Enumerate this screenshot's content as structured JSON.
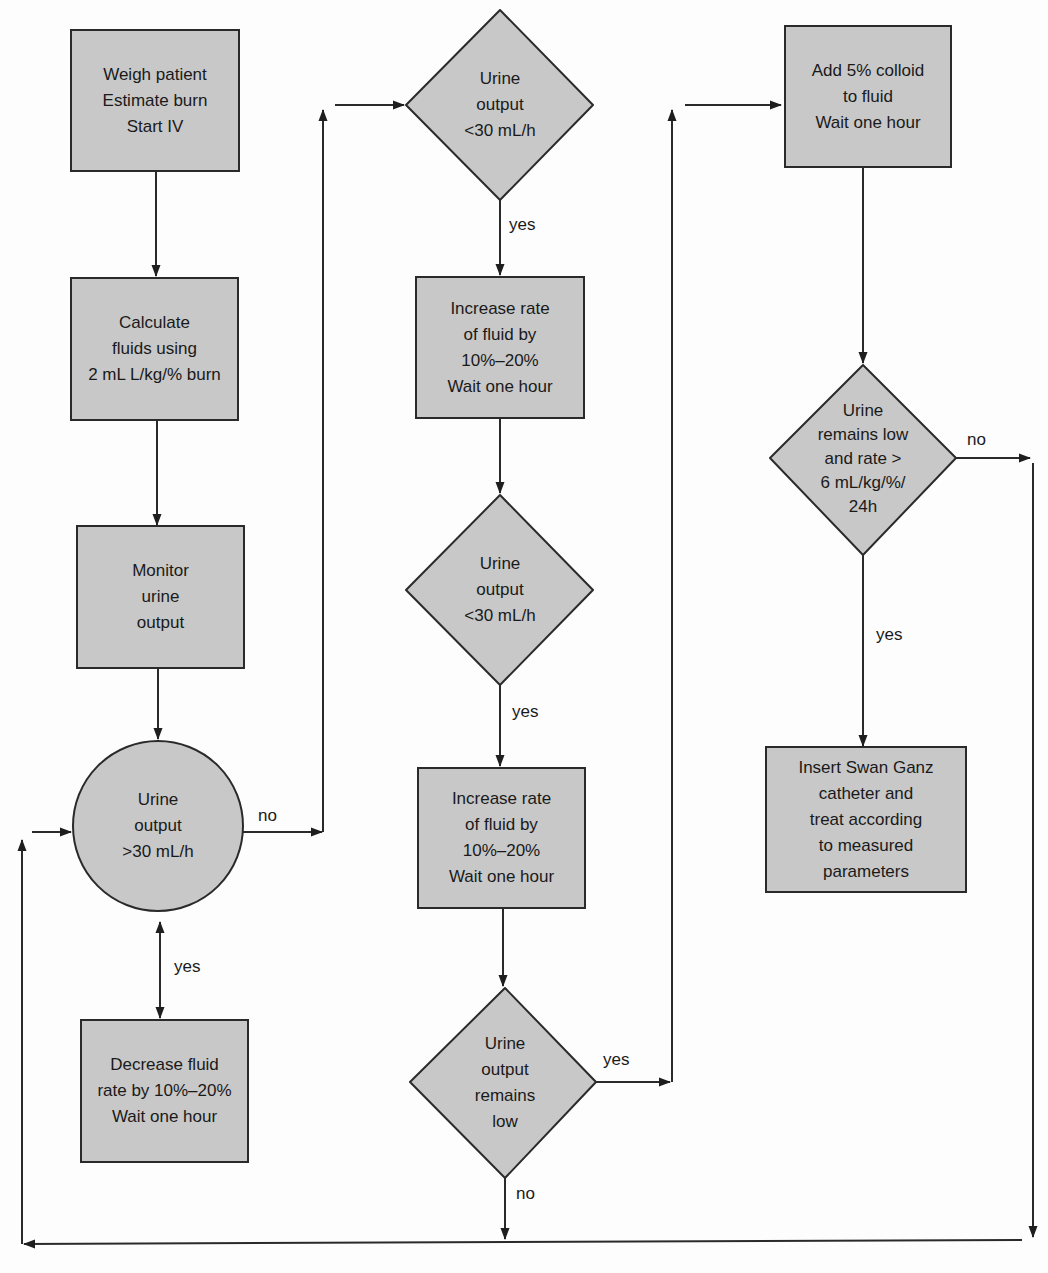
{
  "diagram": {
    "type": "flowchart",
    "colors": {
      "node_fill": "#c8c8c8",
      "stroke": "#2a2a2a",
      "background": "#fdfdfd"
    },
    "nodes": {
      "start": {
        "shape": "rectangle",
        "text": "Weigh patient\nEstimate burn\nStart IV"
      },
      "calculate": {
        "shape": "rectangle",
        "text": "Calculate\nfluids using\n2 mL L/kg/% burn"
      },
      "monitor": {
        "shape": "rectangle",
        "text": "Monitor\nurine\noutput"
      },
      "check_gt30": {
        "shape": "circle",
        "text": "Urine\noutput\n>30 mL/h"
      },
      "decrease": {
        "shape": "rectangle",
        "text": "Decrease fluid\nrate by 10%–20%\nWait one hour"
      },
      "check_lt30_a": {
        "shape": "diamond",
        "text": "Urine\noutput\n<30 mL/h"
      },
      "increase_a": {
        "shape": "rectangle",
        "text": "Increase rate\nof fluid by\n10%–20%\nWait one hour"
      },
      "check_lt30_b": {
        "shape": "diamond",
        "text": "Urine\noutput\n<30 mL/h"
      },
      "increase_b": {
        "shape": "rectangle",
        "text": "Increase rate\nof fluid by\n10%–20%\nWait one hour"
      },
      "remains_low": {
        "shape": "diamond",
        "text": "Urine\noutput\nremains\nlow"
      },
      "add_colloid": {
        "shape": "rectangle",
        "text": "Add 5% colloid\nto fluid\nWait one hour"
      },
      "low_and_rate": {
        "shape": "diamond",
        "text": "Urine\nremains low\nand rate >\n6 mL/kg/%/\n24h"
      },
      "swan_ganz": {
        "shape": "rectangle",
        "text": "Insert Swan Ganz\ncatheter and\ntreat according\nto measured\nparameters"
      }
    },
    "edge_labels": {
      "gt30_no": "no",
      "gt30_yes": "yes",
      "lt30a_yes": "yes",
      "lt30b_yes": "yes",
      "remains_low_yes": "yes",
      "remains_low_no": "no",
      "low_rate_no": "no",
      "low_rate_yes": "yes"
    },
    "edges": [
      {
        "from": "start",
        "to": "calculate"
      },
      {
        "from": "calculate",
        "to": "monitor"
      },
      {
        "from": "monitor",
        "to": "check_gt30"
      },
      {
        "from": "check_gt30",
        "to": "decrease",
        "label": "yes",
        "bidirectional": true
      },
      {
        "from": "check_gt30",
        "to": "check_lt30_a",
        "label": "no"
      },
      {
        "from": "check_lt30_a",
        "to": "increase_a",
        "label": "yes"
      },
      {
        "from": "increase_a",
        "to": "check_lt30_b"
      },
      {
        "from": "check_lt30_b",
        "to": "increase_b",
        "label": "yes"
      },
      {
        "from": "increase_b",
        "to": "remains_low"
      },
      {
        "from": "remains_low",
        "to": "add_colloid",
        "label": "yes"
      },
      {
        "from": "remains_low",
        "to": "check_gt30",
        "label": "no",
        "via": "bottom return line"
      },
      {
        "from": "add_colloid",
        "to": "low_and_rate"
      },
      {
        "from": "low_and_rate",
        "to": "swan_ganz",
        "label": "yes"
      },
      {
        "from": "low_and_rate",
        "to": "check_gt30",
        "label": "no",
        "via": "right side line to bottom return line"
      }
    ]
  }
}
